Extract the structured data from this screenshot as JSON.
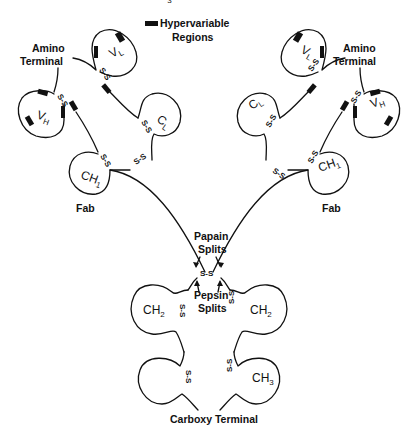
{
  "diagram": {
    "type": "antibody-structure",
    "legend": {
      "swatch_color": "#111111",
      "line1": "Hypervariable",
      "line2": "Regions"
    },
    "labels": {
      "amino_terminal_left_1": "Amino",
      "amino_terminal_left_2": "Terminal",
      "amino_terminal_right_1": "Amino",
      "amino_terminal_right_2": "Terminal",
      "fab_left": "Fab",
      "fab_right": "Fab",
      "papain_1": "Papain",
      "papain_2": "Splits",
      "pepsin_1": "Pepsin",
      "pepsin_2": "Splits",
      "carboxy_terminal": "Carboxy Terminal"
    },
    "domains": {
      "vl_left": {
        "main": "V",
        "sub": "L"
      },
      "vh_left": {
        "main": "V",
        "sub": "H"
      },
      "cl_left": {
        "main": "C",
        "sub": "L"
      },
      "ch1_left": {
        "main": "CH",
        "sub": "1"
      },
      "vl_right": {
        "main": "V",
        "sub": "L"
      },
      "vh_right": {
        "main": "V",
        "sub": "H"
      },
      "cl_right": {
        "main": "C",
        "sub": "L"
      },
      "ch1_right": {
        "main": "CH",
        "sub": "1"
      },
      "ch2_left": {
        "main": "CH",
        "sub": "2"
      },
      "ch2_right": {
        "main": "CH",
        "sub": "2"
      },
      "ch3_left": {
        "main": "CH",
        "sub": "3"
      },
      "ch3_right": {
        "main": "CH",
        "sub": "3"
      }
    },
    "disulfide_label": "S-S",
    "disulfide_vertical": "S-S",
    "colors": {
      "ink": "#111111",
      "background": "#ffffff"
    }
  }
}
